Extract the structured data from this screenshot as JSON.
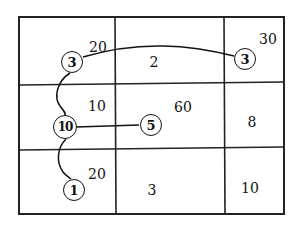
{
  "grid": {
    "rows": 3,
    "cols": 3,
    "cell_values": [
      [
        "20",
        "2",
        "30"
      ],
      [
        "10",
        "60",
        "8"
      ],
      [
        "20",
        "3",
        "10"
      ]
    ]
  },
  "nodes": [
    {
      "id": "n_top_left",
      "label": "3"
    },
    {
      "id": "n_top_right",
      "label": "3"
    },
    {
      "id": "n_mid_left",
      "label": "10"
    },
    {
      "id": "n_mid_center",
      "label": "5"
    },
    {
      "id": "n_bottom_left",
      "label": "1"
    }
  ],
  "colors": {
    "line": "#111111",
    "background": "#ffffff"
  }
}
